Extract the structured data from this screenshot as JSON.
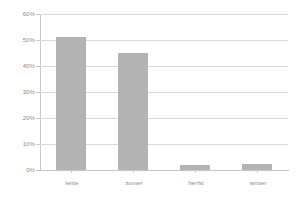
{
  "chart_data": {
    "type": "bar",
    "title": "",
    "subtitle": "",
    "xlabel": "",
    "ylabel": "",
    "categories": [
      "lente",
      "zomer",
      "herfst",
      "winter"
    ],
    "values": [
      51,
      45,
      2,
      2.5
    ],
    "value_labels": [
      "51%",
      "45%",
      "2%",
      "2.5%"
    ],
    "series": [
      {
        "name": "",
        "values": [
          51,
          45,
          2,
          2.5
        ]
      }
    ],
    "ylim": [
      0,
      60
    ],
    "ytick_values": [
      0,
      10,
      20,
      30,
      40,
      50,
      60
    ],
    "ytick_labels": [
      "0%",
      "10%",
      "20%",
      "30%",
      "40%",
      "50%",
      "60%"
    ],
    "grid": true,
    "grid_axis": "y",
    "legend": false,
    "legend_position": "none",
    "bar_color": "#b3b3b3",
    "grid_color": "#d9d9d9",
    "axis_color": "#c8c8c8",
    "tick_label_color": "#8c8c8c",
    "background_color": "#ffffff"
  }
}
